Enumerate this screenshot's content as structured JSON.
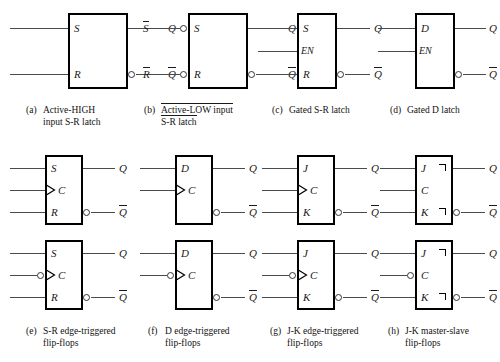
{
  "figure": {
    "kind": "logic-symbol-chart",
    "columns": 4,
    "rows": 3,
    "line_color": "#4a4a4a",
    "box_border_color": "#000000",
    "background": "#ffffff"
  },
  "symbols": {
    "a": {
      "tag": "(a)",
      "caption_line1": "Active-HIGH",
      "caption_line2": "input S-R latch",
      "inputs": [
        {
          "name": "S",
          "label": "S",
          "inverted": false,
          "bubble": false,
          "dynamic": false
        },
        {
          "name": "R",
          "label": "R",
          "inverted": false,
          "bubble": false,
          "dynamic": false
        }
      ],
      "outputs": [
        {
          "name": "Q",
          "label": "Q",
          "bubble": false,
          "overbar": false
        },
        {
          "name": "Qbar",
          "label": "Q",
          "bubble": true,
          "overbar": true
        }
      ]
    },
    "b": {
      "tag": "(b)",
      "caption_line1": "Active-LOW input",
      "caption_line2": "S-R latch",
      "caption_line1_overbar_part": "",
      "external_input_labels": [
        "S",
        "R"
      ],
      "external_input_overbar": true,
      "inputs": [
        {
          "name": "S",
          "label": "S",
          "inverted": true,
          "bubble": true,
          "dynamic": false
        },
        {
          "name": "R",
          "label": "R",
          "inverted": true,
          "bubble": true,
          "dynamic": false
        }
      ],
      "outputs": [
        {
          "name": "Q",
          "label": "Q",
          "bubble": false,
          "overbar": false
        },
        {
          "name": "Qbar",
          "label": "Q",
          "bubble": true,
          "overbar": true
        }
      ]
    },
    "c": {
      "tag": "(c)",
      "caption_line1": "Gated S-R latch",
      "caption_line2": "",
      "inputs": [
        {
          "name": "S",
          "label": "S",
          "inverted": false,
          "bubble": false,
          "dynamic": false
        },
        {
          "name": "EN",
          "label": "EN",
          "inverted": false,
          "bubble": false,
          "dynamic": false
        },
        {
          "name": "R",
          "label": "R",
          "inverted": false,
          "bubble": false,
          "dynamic": false
        }
      ],
      "outputs": [
        {
          "name": "Q",
          "label": "Q",
          "bubble": false,
          "overbar": false
        },
        {
          "name": "Qbar",
          "label": "Q",
          "bubble": true,
          "overbar": true
        }
      ]
    },
    "d": {
      "tag": "(d)",
      "caption_line1": "Gated D latch",
      "caption_line2": "",
      "inputs": [
        {
          "name": "D",
          "label": "D",
          "inverted": false,
          "bubble": false,
          "dynamic": false
        },
        {
          "name": "EN",
          "label": "EN",
          "inverted": false,
          "bubble": false,
          "dynamic": false
        }
      ],
      "outputs": [
        {
          "name": "Q",
          "label": "Q",
          "bubble": false,
          "overbar": false
        },
        {
          "name": "Qbar",
          "label": "Q",
          "bubble": true,
          "overbar": true
        }
      ]
    },
    "e": {
      "tag": "(e)",
      "caption_line1": "S-R edge-triggered",
      "caption_line2": "flip-flops",
      "top": {
        "edge": "positive",
        "inputs": [
          {
            "name": "S",
            "label": "S",
            "dynamic": false,
            "bubble": false
          },
          {
            "name": "C",
            "label": "C",
            "dynamic": true,
            "bubble": false
          },
          {
            "name": "R",
            "label": "R",
            "dynamic": false,
            "bubble": false
          }
        ]
      },
      "bottom": {
        "edge": "negative",
        "inputs": [
          {
            "name": "S",
            "label": "S",
            "dynamic": false,
            "bubble": false
          },
          {
            "name": "C",
            "label": "C",
            "dynamic": true,
            "bubble": true
          },
          {
            "name": "R",
            "label": "R",
            "dynamic": false,
            "bubble": false
          }
        ]
      },
      "outputs": [
        {
          "name": "Q",
          "label": "Q",
          "bubble": false,
          "overbar": false
        },
        {
          "name": "Qbar",
          "label": "Q",
          "bubble": true,
          "overbar": true
        }
      ]
    },
    "f": {
      "tag": "(f)",
      "caption_line1": "D edge-triggered",
      "caption_line2": "flip-flops",
      "top": {
        "edge": "positive",
        "inputs": [
          {
            "name": "D",
            "label": "D",
            "dynamic": false,
            "bubble": false
          },
          {
            "name": "C",
            "label": "C",
            "dynamic": true,
            "bubble": false
          }
        ]
      },
      "bottom": {
        "edge": "negative",
        "inputs": [
          {
            "name": "D",
            "label": "D",
            "dynamic": false,
            "bubble": false
          },
          {
            "name": "C",
            "label": "C",
            "dynamic": true,
            "bubble": true
          }
        ]
      },
      "outputs": [
        {
          "name": "Q",
          "label": "Q",
          "bubble": false,
          "overbar": false
        },
        {
          "name": "Qbar",
          "label": "Q",
          "bubble": true,
          "overbar": true
        }
      ]
    },
    "g": {
      "tag": "(g)",
      "caption_line1": "J-K edge-triggered",
      "caption_line2": "flip-flops",
      "top": {
        "edge": "positive",
        "inputs": [
          {
            "name": "J",
            "label": "J",
            "dynamic": false,
            "bubble": false
          },
          {
            "name": "C",
            "label": "C",
            "dynamic": true,
            "bubble": false
          },
          {
            "name": "K",
            "label": "K",
            "dynamic": false,
            "bubble": false
          }
        ]
      },
      "bottom": {
        "edge": "negative",
        "inputs": [
          {
            "name": "J",
            "label": "J",
            "dynamic": false,
            "bubble": false
          },
          {
            "name": "C",
            "label": "C",
            "dynamic": true,
            "bubble": true
          },
          {
            "name": "K",
            "label": "K",
            "dynamic": false,
            "bubble": false
          }
        ]
      },
      "outputs": [
        {
          "name": "Q",
          "label": "Q",
          "bubble": false,
          "overbar": false
        },
        {
          "name": "Qbar",
          "label": "Q",
          "bubble": true,
          "overbar": true
        }
      ]
    },
    "h": {
      "tag": "(h)",
      "caption_line1": "J-K master-slave",
      "caption_line2": "flip-flops",
      "postponed_output_marker": true,
      "top": {
        "edge": "pulse",
        "inputs": [
          {
            "name": "J",
            "label": "J",
            "dynamic": false,
            "bubble": false,
            "postponed": true
          },
          {
            "name": "C",
            "label": "C",
            "dynamic": false,
            "bubble": false
          },
          {
            "name": "K",
            "label": "K",
            "dynamic": false,
            "bubble": false,
            "postponed": true
          }
        ]
      },
      "bottom": {
        "edge": "pulse-inverted",
        "inputs": [
          {
            "name": "J",
            "label": "J",
            "dynamic": false,
            "bubble": false,
            "postponed": true
          },
          {
            "name": "C",
            "label": "C",
            "dynamic": false,
            "bubble": true
          },
          {
            "name": "K",
            "label": "K",
            "dynamic": false,
            "bubble": false,
            "postponed": true
          }
        ]
      },
      "outputs": [
        {
          "name": "Q",
          "label": "Q",
          "bubble": false,
          "overbar": false
        },
        {
          "name": "Qbar",
          "label": "Q",
          "bubble": true,
          "overbar": true
        }
      ]
    }
  }
}
